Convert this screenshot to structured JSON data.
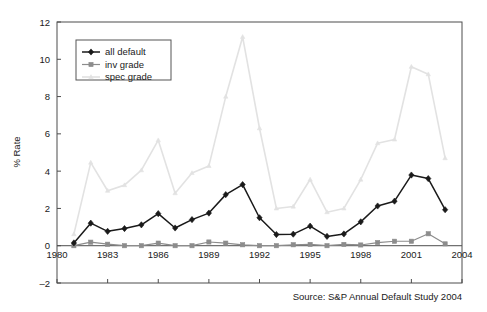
{
  "chart_data": {
    "type": "line",
    "title": "",
    "xlabel": "",
    "ylabel": "% Rate",
    "xlim": [
      1980,
      2004
    ],
    "ylim": [
      -2,
      12
    ],
    "yticks": [
      "-2",
      "0",
      "2",
      "4",
      "6",
      "8",
      "10",
      "12"
    ],
    "xticks": [
      "1980",
      "1983",
      "1986",
      "1989",
      "1992",
      "1995",
      "1998",
      "2001",
      "2004"
    ],
    "grid": false,
    "legend_position": "top-left",
    "x": [
      1981,
      1982,
      1983,
      1984,
      1985,
      1986,
      1987,
      1988,
      1989,
      1990,
      1991,
      1992,
      1993,
      1994,
      1995,
      1996,
      1997,
      1998,
      1999,
      2000,
      2001,
      2002,
      2003
    ],
    "series": [
      {
        "name": "all default",
        "color": "#1a1a1a",
        "marker": "diamond",
        "values": [
          0.15,
          1.21,
          0.77,
          0.92,
          1.12,
          1.72,
          0.95,
          1.4,
          1.75,
          2.74,
          3.28,
          1.5,
          0.6,
          0.62,
          1.05,
          0.5,
          0.63,
          1.28,
          2.13,
          2.39,
          3.79,
          3.6,
          1.93
        ]
      },
      {
        "name": "inv grade",
        "color": "#8c8c8c",
        "marker": "square",
        "values": [
          0.0,
          0.19,
          0.08,
          0.0,
          0.0,
          0.14,
          0.0,
          0.0,
          0.2,
          0.14,
          0.05,
          0.0,
          0.0,
          0.05,
          0.07,
          0.0,
          0.07,
          0.04,
          0.17,
          0.24,
          0.24,
          0.64,
          0.1
        ]
      },
      {
        "name": "spec grade",
        "color": "#e2e2e2",
        "marker": "triangle",
        "values": [
          0.62,
          4.46,
          2.95,
          3.25,
          4.05,
          5.66,
          2.82,
          3.9,
          4.28,
          8.0,
          11.2,
          6.3,
          2.0,
          2.1,
          3.55,
          1.8,
          2.0,
          3.55,
          5.5,
          5.7,
          9.6,
          9.2,
          4.7
        ]
      }
    ]
  },
  "source": {
    "text": "Source:  S&P Annual Default Study  2004"
  },
  "legend": {
    "items": [
      {
        "label": "all default"
      },
      {
        "label": "inv grade"
      },
      {
        "label": "spec grade"
      }
    ]
  }
}
